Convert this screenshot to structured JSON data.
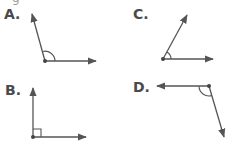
{
  "figure": {
    "top_cut_text": "g",
    "colors": {
      "line": "#555555",
      "label": "#4a4a4a"
    },
    "options": [
      {
        "label": "A.",
        "angle_type": "obtuse",
        "marker": "arc"
      },
      {
        "label": "C.",
        "angle_type": "acute",
        "marker": "arc"
      },
      {
        "label": "B.",
        "angle_type": "right",
        "marker": "square"
      },
      {
        "label": "D.",
        "angle_type": "obtuse",
        "marker": "arc"
      }
    ]
  }
}
